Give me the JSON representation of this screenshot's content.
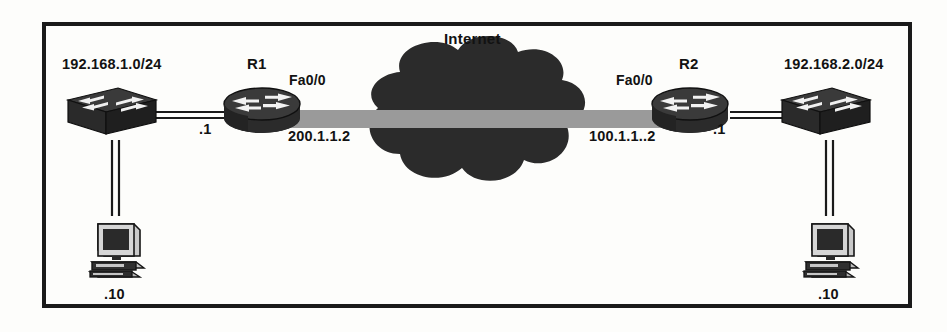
{
  "diagram": {
    "type": "network-topology",
    "title": "Internet",
    "frame": {
      "border_color": "#1a1a1a",
      "background": "#fdfdfb"
    },
    "palette": {
      "device_dark": "#262626",
      "device_mid": "#3d3d3d",
      "link_gray": "#9a9a9a",
      "line_black": "#1a1a1a",
      "text": "#121212"
    },
    "left_site": {
      "subnet_label": "192.168.1.0/24",
      "switch_name": "switch-left",
      "host_label": ".10",
      "router_interface_ip": ".1"
    },
    "right_site": {
      "subnet_label": "192.168.2.0/24",
      "switch_name": "switch-right",
      "host_label": ".10",
      "router_interface_ip": ".1"
    },
    "router_left": {
      "name": "R1",
      "interface_label": "Fa0/0",
      "interface_ip": "200.1.1.2"
    },
    "router_right": {
      "name": "R2",
      "interface_label": "Fa0/0",
      "interface_ip": "100.1.1..2"
    },
    "cloud": {
      "label": "Internet"
    }
  }
}
